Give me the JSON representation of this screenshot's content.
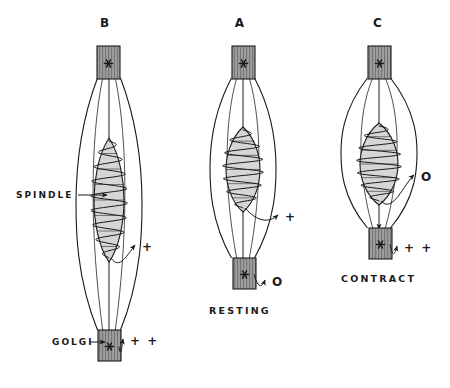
{
  "figure": {
    "background_color": "#ffffff",
    "ink_color": "#1a1a1a",
    "tendon_fill": "#9e9e9e",
    "spindle_fill": "#d6d6d6",
    "muscle_fill": "#ffffff"
  },
  "panels": [
    {
      "letter": "B",
      "state_label": "",
      "letter_x": 85,
      "letter_y": 16,
      "center_x": 109,
      "muscle": {
        "top_y": 78,
        "bottom_y": 330,
        "half_width": 33
      },
      "top_tendon": {
        "x": 97,
        "y": 46,
        "w": 23,
        "h": 33,
        "marker": "*"
      },
      "bottom_tendon": {
        "x": 98,
        "y": 330,
        "w": 23,
        "h": 31,
        "marker": "*"
      },
      "spindle": {
        "cx": 109,
        "top_y": 138,
        "bottom_y": 262,
        "half_width": 15,
        "coils": 8
      },
      "annotations": [
        {
          "name": "spindle-output",
          "symbol": "+",
          "x": 142,
          "y": 240
        },
        {
          "name": "golgi-output",
          "symbol": "+ +",
          "x": 130,
          "y": 334
        }
      ],
      "part_labels": [
        {
          "name": "spindle",
          "text": "SPINDLE",
          "x": 16,
          "y": 190
        },
        {
          "name": "golgi",
          "text": "GOLGI",
          "x": 52,
          "y": 337
        }
      ]
    },
    {
      "letter": "A",
      "state_label": "RESTING",
      "letter_x": 220,
      "letter_y": 16,
      "center_x": 243,
      "state_x": 209,
      "state_y": 305,
      "muscle": {
        "top_y": 78,
        "bottom_y": 258,
        "half_width": 33
      },
      "top_tendon": {
        "x": 232,
        "y": 46,
        "w": 23,
        "h": 33,
        "marker": "*"
      },
      "bottom_tendon": {
        "x": 233,
        "y": 258,
        "w": 23,
        "h": 31,
        "marker": "*"
      },
      "spindle": {
        "cx": 243,
        "top_y": 127,
        "bottom_y": 212,
        "half_width": 17,
        "coils": 6
      },
      "annotations": [
        {
          "name": "spindle-output",
          "symbol": "+",
          "x": 285,
          "y": 210
        },
        {
          "name": "golgi-output",
          "symbol": "O",
          "x": 272,
          "y": 275
        }
      ],
      "part_labels": []
    },
    {
      "letter": "C",
      "state_label": "CONTRACT",
      "letter_x": 358,
      "letter_y": 16,
      "center_x": 379,
      "state_x": 341,
      "state_y": 273,
      "muscle": {
        "top_y": 78,
        "bottom_y": 228,
        "half_width": 38
      },
      "top_tendon": {
        "x": 368,
        "y": 46,
        "w": 23,
        "h": 33,
        "marker": "*"
      },
      "bottom_tendon": {
        "x": 369,
        "y": 228,
        "w": 23,
        "h": 31,
        "marker": "*"
      },
      "spindle": {
        "cx": 379,
        "top_y": 123,
        "bottom_y": 205,
        "half_width": 19,
        "coils": 6
      },
      "annotations": [
        {
          "name": "spindle-output",
          "symbol": "O",
          "x": 421,
          "y": 170
        },
        {
          "name": "golgi-output",
          "symbol": "+ +",
          "x": 404,
          "y": 241
        }
      ],
      "part_labels": []
    }
  ]
}
